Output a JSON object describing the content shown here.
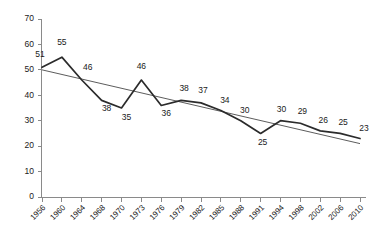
{
  "chart_data": {
    "type": "line",
    "title": "",
    "subtitle": "",
    "xlabel": "",
    "ylabel": "",
    "categories": [
      "1956",
      "1960",
      "1964",
      "1968",
      "1970",
      "1973",
      "1976",
      "1979",
      "1982",
      "1985",
      "1988",
      "1991",
      "1994",
      "1998",
      "2002",
      "2006",
      "2010"
    ],
    "values": [
      51,
      55,
      46,
      38,
      35,
      46,
      36,
      38,
      37,
      34,
      30,
      25,
      30,
      29,
      26,
      25,
      23
    ],
    "data_labels": [
      "51",
      "55",
      "46",
      "38",
      "35",
      "46",
      "36",
      "38",
      "37",
      "34",
      "30",
      "25",
      "30",
      "29",
      "26",
      "25",
      "23"
    ],
    "ylim": [
      0,
      70
    ],
    "yticks": [
      0,
      10,
      20,
      30,
      40,
      50,
      60,
      70
    ],
    "ytick_labels": [
      "0",
      "10",
      "20",
      "30",
      "40",
      "50",
      "60",
      "70"
    ],
    "grid": false,
    "legend": false,
    "legend_position": "none",
    "series": [
      {
        "name": "series-1",
        "kind": "line",
        "color": "#2b2b2b",
        "values": [
          51,
          55,
          46,
          38,
          35,
          46,
          36,
          38,
          37,
          34,
          30,
          25,
          30,
          29,
          26,
          25,
          23
        ]
      },
      {
        "name": "trendline",
        "kind": "linear-trend",
        "color": "#4a4a4a",
        "endpoints": [
          50,
          21
        ]
      }
    ],
    "annotations": []
  },
  "axes": {
    "y_axis_name": "y-axis",
    "x_axis_name": "x-axis"
  }
}
